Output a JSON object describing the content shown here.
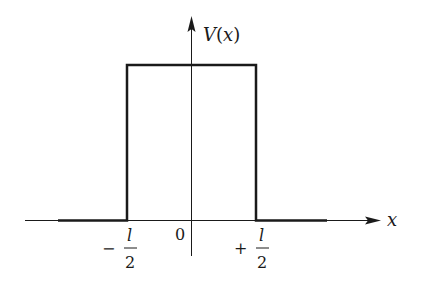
{
  "diagram": {
    "type": "square-barrier-potential",
    "y_axis_label": "V(x)",
    "x_axis_label": "x",
    "origin_label": "0",
    "left_edge": {
      "sign": "−",
      "numerator": "l",
      "denominator": "2"
    },
    "right_edge": {
      "sign": "+",
      "numerator": "l",
      "denominator": "2"
    },
    "line_color": "#1a1a1a"
  }
}
